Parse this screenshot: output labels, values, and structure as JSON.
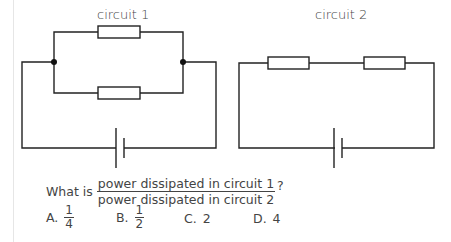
{
  "circuit1": {
    "label": "circuit 1",
    "resistors": 2,
    "arrangement": "parallel"
  },
  "circuit2": {
    "label": "circuit 2",
    "resistors": 2,
    "arrangement": "series"
  },
  "question": {
    "prefix": "What is",
    "numerator": "power dissipated in circuit 1",
    "denominator": "power dissipated in circuit 2",
    "suffix": "?"
  },
  "options": [
    {
      "letter": "A.",
      "type": "fraction",
      "num": "1",
      "den": "4"
    },
    {
      "letter": "B.",
      "type": "fraction",
      "num": "1",
      "den": "2"
    },
    {
      "letter": "C.",
      "type": "value",
      "value": "2"
    },
    {
      "letter": "D.",
      "type": "value",
      "value": "4"
    }
  ]
}
